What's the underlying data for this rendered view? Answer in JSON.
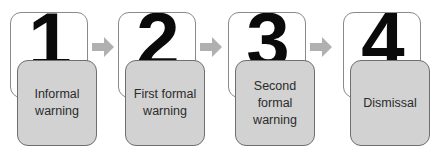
{
  "diagram": {
    "type": "process-flow",
    "colors": {
      "card_back": "#ffffff",
      "card_front": "#d2d2d2",
      "arrow": "#b0b0b0",
      "number": "#0a0a0a"
    },
    "steps": [
      {
        "number": "1",
        "label": "Informal\nwarning"
      },
      {
        "number": "2",
        "label": "First formal\nwarning"
      },
      {
        "number": "3",
        "label": "Second\nformal\nwarning"
      },
      {
        "number": "4",
        "label": "Dismissal"
      }
    ],
    "arrows": [
      "arrow-right-icon",
      "arrow-right-icon",
      "arrow-right-icon"
    ]
  }
}
